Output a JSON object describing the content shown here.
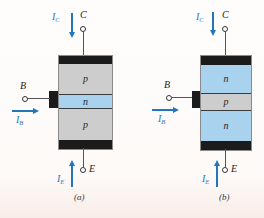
{
  "palette": {
    "p_region": "#cdcdcd",
    "n_region": "#a8d2ee",
    "metal_contact": "#1b1b1b",
    "current_blue": "#2176bd",
    "wire": "#555555",
    "background": "#fdfaf8"
  },
  "figures": [
    {
      "caption": "(a)",
      "collector_terminal": "C",
      "base_terminal": "B",
      "emitter_terminal": "E",
      "collector_current": {
        "sym": "I",
        "sub": "C"
      },
      "base_current": {
        "sym": "I",
        "sub": "B"
      },
      "emitter_current": {
        "sym": "I",
        "sub": "E"
      },
      "regions": [
        {
          "label": "p"
        },
        {
          "label": "n"
        },
        {
          "label": "p"
        }
      ]
    },
    {
      "caption": "(b)",
      "collector_terminal": "C",
      "base_terminal": "B",
      "emitter_terminal": "E",
      "collector_current": {
        "sym": "I",
        "sub": "C"
      },
      "base_current": {
        "sym": "I",
        "sub": "B"
      },
      "emitter_current": {
        "sym": "I",
        "sub": "E"
      },
      "regions": [
        {
          "label": "n"
        },
        {
          "label": "p"
        },
        {
          "label": "n"
        }
      ]
    }
  ]
}
